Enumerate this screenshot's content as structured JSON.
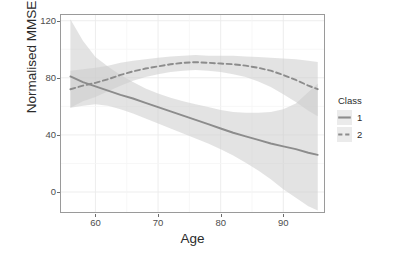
{
  "chart_data": {
    "type": "line",
    "title": "",
    "subtitle": "",
    "xlabel": "Age",
    "ylabel": "Normalised MMSE",
    "xlim": [
      54.5,
      96.5
    ],
    "ylim": [
      -14,
      124
    ],
    "xticks": [
      60,
      70,
      80,
      90
    ],
    "yticks": [
      0,
      40,
      80,
      120
    ],
    "xtick_labels": [
      "60",
      "70",
      "80",
      "90"
    ],
    "ytick_labels": [
      "0",
      "40",
      "80",
      "120"
    ],
    "grid": true,
    "grid_major_color": "#ffffff",
    "panel_background": "#ffffff",
    "panel_border_color": "#9a9a9a",
    "legend_position": "right",
    "legend_title": "Class",
    "ribbon_color": "#cccccc",
    "ribbon_alpha": 0.55,
    "series": [
      {
        "name": "1",
        "label": "1",
        "linetype": "solid",
        "color": "#8c8c8c",
        "x": [
          56.0,
          58.0,
          60.0,
          62.0,
          64.0,
          66.0,
          68.0,
          70.0,
          72.0,
          74.0,
          76.0,
          78.0,
          80.0,
          82.0,
          84.0,
          86.0,
          88.0,
          90.0,
          92.0,
          94.0,
          95.5
        ],
        "values": [
          81.0,
          77.0,
          74.0,
          71.0,
          68.0,
          65.5,
          62.5,
          59.5,
          56.5,
          53.5,
          50.5,
          47.5,
          44.5,
          41.5,
          39.0,
          36.5,
          34.0,
          32.0,
          30.0,
          27.5,
          26.0
        ],
        "ci_lower": [
          59.0,
          60.5,
          61.5,
          60.5,
          58.0,
          55.0,
          51.5,
          48.0,
          44.5,
          41.0,
          37.5,
          34.0,
          30.0,
          25.5,
          20.5,
          15.0,
          9.0,
          2.0,
          -4.0,
          -10.0,
          -13.0
        ],
        "ci_upper": [
          121.0,
          106.0,
          94.5,
          88.0,
          82.0,
          77.0,
          72.5,
          69.0,
          66.0,
          63.5,
          61.5,
          59.5,
          57.5,
          56.0,
          55.5,
          55.5,
          56.0,
          58.0,
          62.0,
          70.0,
          76.0
        ]
      },
      {
        "name": "2",
        "label": "2",
        "linetype": "dashed",
        "color": "#8c8c8c",
        "x": [
          56.0,
          58.0,
          60.0,
          62.0,
          64.0,
          66.0,
          68.0,
          70.0,
          72.0,
          74.0,
          76.0,
          78.0,
          80.0,
          82.0,
          84.0,
          86.0,
          88.0,
          90.0,
          92.0,
          94.0,
          95.5
        ],
        "values": [
          72.0,
          74.5,
          76.5,
          79.0,
          82.0,
          84.5,
          86.5,
          88.0,
          89.5,
          90.5,
          91.0,
          90.5,
          90.0,
          89.5,
          88.5,
          87.0,
          85.0,
          82.0,
          78.5,
          74.5,
          72.0
        ],
        "ci_lower": [
          59.0,
          63.5,
          66.5,
          70.5,
          74.5,
          78.0,
          80.5,
          82.5,
          84.0,
          85.0,
          85.5,
          85.0,
          84.0,
          82.5,
          80.5,
          77.5,
          73.5,
          68.5,
          63.0,
          57.0,
          53.0
        ],
        "ci_upper": [
          85.0,
          86.0,
          87.0,
          88.5,
          90.5,
          92.0,
          93.0,
          94.0,
          95.0,
          95.5,
          96.0,
          95.5,
          95.5,
          95.5,
          95.0,
          94.5,
          94.0,
          93.5,
          93.0,
          92.0,
          91.0
        ]
      }
    ]
  }
}
